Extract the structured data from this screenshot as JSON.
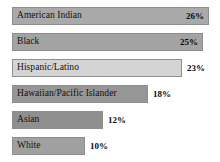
{
  "chart_data": {
    "type": "bar",
    "orientation": "horizontal",
    "title": "",
    "subtitle": "",
    "xlabel": "",
    "ylabel": "",
    "grid": false,
    "legend": null,
    "axis_visible": false,
    "xlim": [
      0,
      26
    ],
    "categories": [
      "American Indian",
      "Black",
      "Hispanic/Latino",
      "Hawaiian/Pacific Islander",
      "Asian",
      "White"
    ],
    "values": [
      26,
      25,
      23,
      18,
      12,
      10
    ],
    "value_labels": [
      "26%",
      "25%",
      "23%",
      "18%",
      "12%",
      "10%"
    ],
    "label_position": [
      "inside",
      "inside",
      "outside",
      "outside",
      "outside",
      "outside"
    ],
    "bar_colors": [
      "#a9a9a9",
      "#a3a3a3",
      "#d4d4d4",
      "#969696",
      "#8f8f8f",
      "#a0a0a0"
    ],
    "bar_border_color": "#8e8e8e",
    "background_color": "#ffffff",
    "text_color": "#111111",
    "bars": [
      {
        "category": "American Indian",
        "value": 26,
        "value_label": "26%",
        "label_position": "inside",
        "color": "#a9a9a9",
        "bar_width_px": 197
      },
      {
        "category": "Black",
        "value": 25,
        "value_label": "25%",
        "label_position": "inside",
        "color": "#a3a3a3",
        "bar_width_px": 191
      },
      {
        "category": "Hispanic/Latino",
        "value": 23,
        "value_label": "23%",
        "label_position": "outside",
        "color": "#d4d4d4",
        "bar_width_px": 170
      },
      {
        "category": "Hawaiian/Pacific Islander",
        "value": 18,
        "value_label": "18%",
        "label_position": "outside",
        "color": "#969696",
        "bar_width_px": 136
      },
      {
        "category": "Asian",
        "value": 12,
        "value_label": "12%",
        "label_position": "outside",
        "color": "#8f8f8f",
        "bar_width_px": 91
      },
      {
        "category": "White",
        "value": 10,
        "value_label": "10%",
        "label_position": "outside",
        "color": "#a0a0a0",
        "bar_width_px": 73
      }
    ]
  }
}
